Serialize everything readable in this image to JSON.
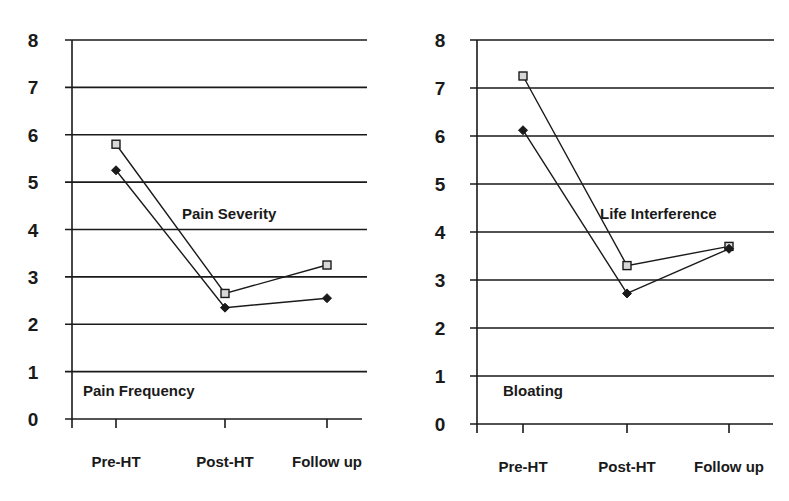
{
  "chart_data": [
    {
      "type": "line",
      "title": "",
      "xlabel": "",
      "ylabel": "",
      "categories": [
        "Pre-HT",
        "Post-HT",
        "Follow up"
      ],
      "ylim": [
        0,
        8
      ],
      "yticks": [
        "0",
        "1",
        "2",
        "3",
        "4",
        "5",
        "6",
        "7",
        "8"
      ],
      "grid": true,
      "series": [
        {
          "name": "Pain Severity",
          "marker": "square",
          "values": [
            5.8,
            2.65,
            3.25
          ]
        },
        {
          "name": "Pain Frequency",
          "marker": "diamond",
          "values": [
            5.25,
            2.35,
            2.55
          ]
        }
      ],
      "annotations": [
        {
          "text": "Pain Severity",
          "position": "middle-center"
        },
        {
          "text": "Pain Frequency",
          "position": "bottom-left"
        }
      ]
    },
    {
      "type": "line",
      "title": "",
      "xlabel": "",
      "ylabel": "",
      "categories": [
        "Pre-HT",
        "Post-HT",
        "Follow up"
      ],
      "ylim": [
        0,
        8
      ],
      "yticks": [
        "0",
        "1",
        "2",
        "3",
        "4",
        "5",
        "6",
        "7",
        "8"
      ],
      "grid": true,
      "series": [
        {
          "name": "Life Interference",
          "marker": "square",
          "values": [
            7.25,
            3.3,
            3.7
          ]
        },
        {
          "name": "Bloating",
          "marker": "diamond",
          "values": [
            6.12,
            2.72,
            3.65
          ]
        }
      ],
      "annotations": [
        {
          "text": "Life Interference",
          "position": "middle-center"
        },
        {
          "text": "Bloating",
          "position": "bottom-left"
        }
      ]
    }
  ]
}
